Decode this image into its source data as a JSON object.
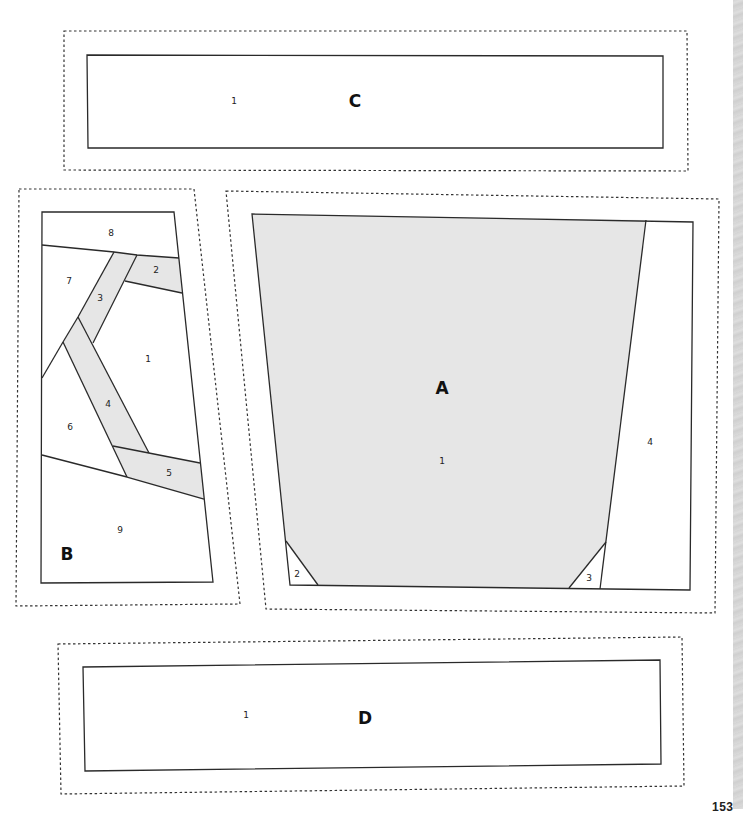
{
  "colors": {
    "shaded_fill": "#e6e6e6",
    "line": "#2a2a2a",
    "decorative_strip": "#d9d9d9"
  },
  "sections": {
    "C": {
      "letter": "C",
      "pieces": [
        {
          "number": "1"
        }
      ]
    },
    "B": {
      "letter": "B",
      "pieces": [
        {
          "number": "1",
          "shaded": false
        },
        {
          "number": "2",
          "shaded": true
        },
        {
          "number": "3",
          "shaded": true
        },
        {
          "number": "4",
          "shaded": true
        },
        {
          "number": "5",
          "shaded": true
        },
        {
          "number": "6",
          "shaded": false
        },
        {
          "number": "7",
          "shaded": false
        },
        {
          "number": "8",
          "shaded": false
        },
        {
          "number": "9",
          "shaded": false
        }
      ]
    },
    "A": {
      "letter": "A",
      "pieces": [
        {
          "number": "1",
          "shaded": true
        },
        {
          "number": "2",
          "shaded": false
        },
        {
          "number": "3",
          "shaded": false
        },
        {
          "number": "4",
          "shaded": false
        }
      ]
    },
    "D": {
      "letter": "D",
      "pieces": [
        {
          "number": "1"
        }
      ]
    }
  },
  "page": {
    "number": "153"
  }
}
